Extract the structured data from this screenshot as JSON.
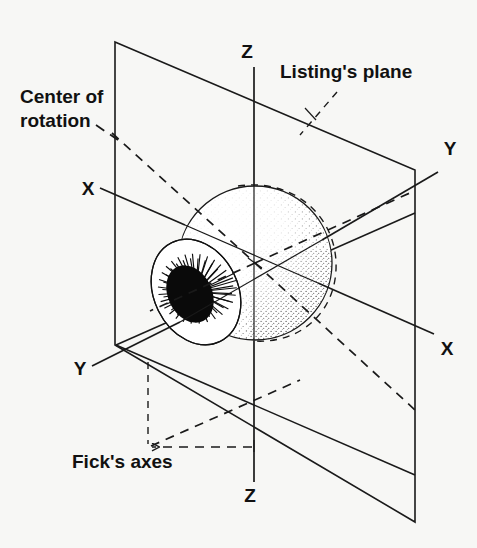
{
  "figure": {
    "background_color": "#f7f7f5",
    "ink_color": "#1a1a1a"
  },
  "labels": {
    "listings_plane": "Listing's plane",
    "center_of_rotation_line1": "Center of",
    "center_of_rotation_line2": "rotation",
    "ficks_axes": "Fick's axes",
    "axis_z_top": "Z",
    "axis_z_bottom": "Z",
    "axis_x_upper_left": "X",
    "axis_x_lower_right": "X",
    "axis_y_upper_right": "Y",
    "axis_y_lower_left": "Y"
  },
  "axes": [
    {
      "name": "Z",
      "orientation": "vertical",
      "top_label": "Z",
      "bottom_label": "Z"
    },
    {
      "name": "X",
      "orientation": "oblique-down-right",
      "near_label": "X",
      "far_label": "X"
    },
    {
      "name": "Y",
      "orientation": "oblique-up-right",
      "near_label": "Y",
      "far_label": "Y"
    }
  ],
  "annotations": [
    {
      "name": "listings-plane",
      "text": "Listing's plane",
      "leader": "dashed"
    },
    {
      "name": "center-of-rotation",
      "text": "Center of rotation",
      "leader": "dashed"
    },
    {
      "name": "ficks-axes",
      "text": "Fick's axes",
      "leader": "dashed-with-arrow"
    }
  ],
  "geometry": {
    "sphere_center": {
      "x": 255,
      "y": 263
    },
    "sphere_radius": 78,
    "cornea_center": {
      "x": 196,
      "y": 292
    },
    "vertical_plane_corners": [
      {
        "x": 115,
        "y": 42
      },
      {
        "x": 415,
        "y": 170
      },
      {
        "x": 415,
        "y": 522
      },
      {
        "x": 115,
        "y": 345
      }
    ]
  }
}
